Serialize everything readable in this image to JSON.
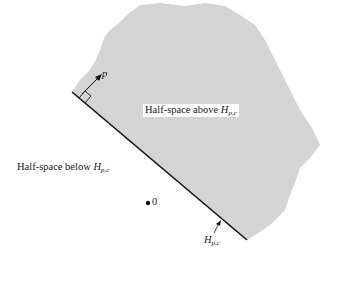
{
  "diagram": {
    "label_above": "Half-space above ",
    "label_below": "Half-space below ",
    "h_symbol": "H",
    "h_subscript": "p,c",
    "vector_label": "p",
    "origin_label": "0",
    "colors": {
      "region": "#d4d4d4",
      "line": "#111111"
    }
  }
}
